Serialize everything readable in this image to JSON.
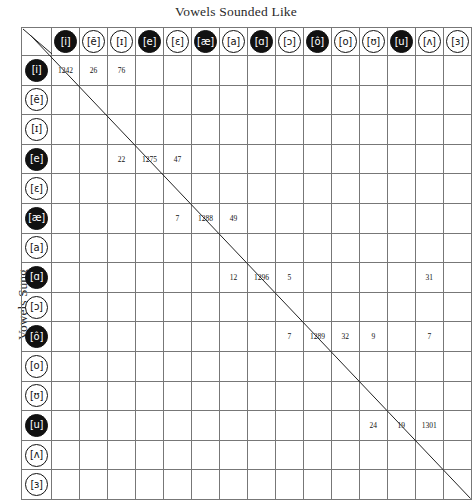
{
  "chart_data": {
    "type": "heatmap",
    "title": "Vowels Sounded Like",
    "xlabel": "Vowels Sounded Like",
    "ylabel": "Vowels Sung",
    "grid": true,
    "legend": "none",
    "note": "Confusion matrix of vowels sung (rows) versus vowels perceived/sounded like (columns). Blank cells are empty. A diagonal line is drawn from the top-left corner cell to the bottom-right of the grid.",
    "categories": [
      "[i]",
      "[ē]",
      "[ɪ]",
      "[e]",
      "[ɛ]",
      "[æ]",
      "[a]",
      "[ɑ]",
      "[ɔ]",
      "[ô]",
      "[o]",
      "[ʊ]",
      "[u]",
      "[ʌ]",
      "[ɜ]"
    ],
    "row_categories": [
      "[i]",
      "[ē]",
      "[ɪ]",
      "[e]",
      "[ɛ]",
      "[æ]",
      "[a]",
      "[ɑ]",
      "[ɔ]",
      "[ô]",
      "[o]",
      "[ʊ]",
      "[u]",
      "[ʌ]",
      "[ɜ]"
    ],
    "filled_markers": [
      true,
      false,
      false,
      true,
      false,
      true,
      false,
      true,
      false,
      true,
      false,
      false,
      true,
      false,
      false
    ],
    "values": [
      [
        1242,
        26,
        76,
        null,
        null,
        null,
        null,
        null,
        null,
        null,
        null,
        null,
        null,
        null,
        null
      ],
      [
        null,
        null,
        null,
        null,
        null,
        null,
        null,
        null,
        null,
        null,
        null,
        null,
        null,
        null,
        null
      ],
      [
        null,
        null,
        null,
        null,
        null,
        null,
        null,
        null,
        null,
        null,
        null,
        null,
        null,
        null,
        null
      ],
      [
        null,
        null,
        22,
        1275,
        47,
        null,
        null,
        null,
        null,
        null,
        null,
        null,
        null,
        null,
        null
      ],
      [
        null,
        null,
        null,
        null,
        null,
        null,
        null,
        null,
        null,
        null,
        null,
        null,
        null,
        null,
        null
      ],
      [
        null,
        null,
        null,
        null,
        7,
        1288,
        49,
        null,
        null,
        null,
        null,
        null,
        null,
        null,
        null
      ],
      [
        null,
        null,
        null,
        null,
        null,
        null,
        null,
        null,
        null,
        null,
        null,
        null,
        null,
        null,
        null
      ],
      [
        null,
        null,
        null,
        null,
        null,
        null,
        12,
        1296,
        5,
        null,
        null,
        null,
        null,
        31,
        null
      ],
      [
        null,
        null,
        null,
        null,
        null,
        null,
        null,
        null,
        null,
        null,
        null,
        null,
        null,
        null,
        null
      ],
      [
        null,
        null,
        null,
        null,
        null,
        null,
        null,
        null,
        7,
        1289,
        32,
        9,
        null,
        7,
        null
      ],
      [
        null,
        null,
        null,
        null,
        null,
        null,
        null,
        null,
        null,
        null,
        null,
        null,
        null,
        null,
        null
      ],
      [
        null,
        null,
        null,
        null,
        null,
        null,
        null,
        null,
        null,
        null,
        null,
        null,
        null,
        null,
        null
      ],
      [
        null,
        null,
        null,
        null,
        null,
        null,
        null,
        null,
        null,
        null,
        null,
        24,
        19,
        1301,
        null
      ],
      [
        null,
        null,
        null,
        null,
        null,
        null,
        null,
        null,
        null,
        null,
        null,
        null,
        null,
        null,
        null
      ],
      [
        null,
        null,
        null,
        null,
        null,
        null,
        null,
        null,
        null,
        null,
        null,
        null,
        null,
        null,
        null
      ]
    ]
  },
  "colors": {
    "marker_fill": "#111111",
    "marker_empty": "#ffffff",
    "grid_line": "#777777",
    "border": "#111111",
    "text": "#1a1a1a"
  }
}
